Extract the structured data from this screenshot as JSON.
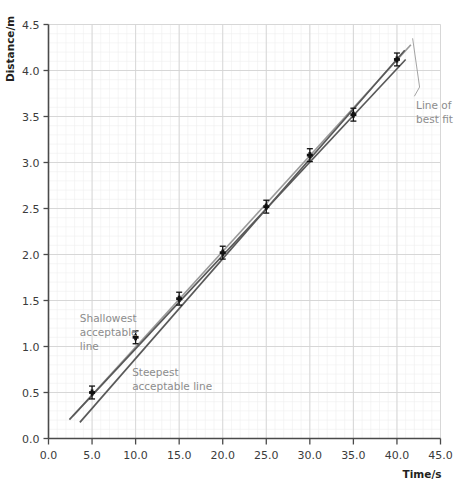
{
  "chart_data": {
    "type": "scatter",
    "title": "",
    "xlabel": "Time/s",
    "ylabel": "Distance/m",
    "xlim": [
      0.0,
      45.0
    ],
    "ylim": [
      0.0,
      4.5
    ],
    "xticks": [
      "0.0",
      "5.0",
      "10.0",
      "15.0",
      "20.0",
      "25.0",
      "30.0",
      "35.0",
      "40.0",
      "45.0"
    ],
    "yticks": [
      "0.0",
      "0.5",
      "1.0",
      "1.5",
      "2.0",
      "2.5",
      "3.0",
      "3.5",
      "4.0",
      "4.5"
    ],
    "xtick_values": [
      0,
      5,
      10,
      15,
      20,
      25,
      30,
      35,
      40,
      45
    ],
    "ytick_values": [
      0,
      0.5,
      1.0,
      1.5,
      2.0,
      2.5,
      3.0,
      3.5,
      4.0,
      4.5
    ],
    "grid": true,
    "minor_grid": true,
    "legend": "none",
    "x": [
      5,
      10,
      15,
      20,
      25,
      30,
      35,
      40
    ],
    "y": [
      0.5,
      1.1,
      1.52,
      2.02,
      2.52,
      3.08,
      3.52,
      4.12
    ],
    "yerr": [
      0.07,
      0.07,
      0.07,
      0.07,
      0.07,
      0.07,
      0.07,
      0.07
    ],
    "marker": "cross",
    "series": [
      {
        "name": "Line of best fit",
        "type": "line",
        "color": "#9a9a9a",
        "x": [
          2.8,
          41.6
        ],
        "y": [
          0.245,
          4.28
        ]
      },
      {
        "name": "Shallowest acceptable line",
        "type": "line",
        "color": "#595959",
        "x": [
          2.4,
          41.0
        ],
        "y": [
          0.205,
          4.12
        ]
      },
      {
        "name": "Steepest acceptable line",
        "type": "line",
        "color": "#595959",
        "x": [
          3.6,
          40.9
        ],
        "y": [
          0.175,
          4.22
        ]
      }
    ],
    "annotations": [
      {
        "name": "line-of-best-fit",
        "text_lines": [
          "Line of",
          "best fit"
        ],
        "x": 42.2,
        "y": 3.58
      },
      {
        "name": "shallowest-acceptable-line",
        "text_lines": [
          "Shallowest",
          "acceptable",
          "line"
        ],
        "x": 3.6,
        "y": 1.27
      },
      {
        "name": "steepest-acceptable-line",
        "text_lines": [
          "Steepest",
          "acceptable line"
        ],
        "x": 9.6,
        "y": 0.68
      }
    ]
  },
  "axes": {
    "y_title": "Distance/m",
    "x_title": "Time/s"
  },
  "colors": {
    "best_fit": "#9a9a9a",
    "acceptable": "#595959",
    "marker": "#111111",
    "grid_major": "#d4d4d4",
    "grid_minor": "#efefef",
    "annotation_text": "#8c8c8c",
    "axis": "#4a4a4a"
  }
}
